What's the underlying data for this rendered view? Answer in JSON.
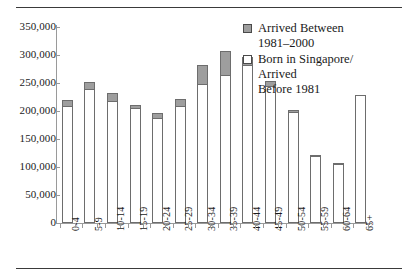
{
  "chart_data": {
    "type": "bar",
    "subtype": "stacked-vertical",
    "title": "",
    "xlabel": "",
    "ylabel": "",
    "ylim": [
      0,
      350000
    ],
    "ytick_values": [
      0,
      50000,
      100000,
      150000,
      200000,
      250000,
      300000,
      350000
    ],
    "ytick_labels": [
      "0",
      "50,000",
      "100,000",
      "150,000",
      "200,000",
      "250,000",
      "300,000",
      "350,000"
    ],
    "grid": false,
    "legend_position": "top-right",
    "categories": [
      "0-4",
      "5-9",
      "10-14",
      "15-19",
      "20-24",
      "25-29",
      "30-34",
      "35-39",
      "40-44",
      "45-49",
      "50-54",
      "55-59",
      "60-64",
      "65+"
    ],
    "series": [
      {
        "name": "Born in Singapore/ Arrived Before 1981",
        "color": "#ffffff",
        "values": [
          207000,
          237000,
          216000,
          203000,
          186000,
          207000,
          247000,
          263000,
          281000,
          243000,
          197000,
          119000,
          106000,
          229000
        ]
      },
      {
        "name": "Arrived Between 1981-2000",
        "color": "#9e9e9e",
        "values": [
          13000,
          15000,
          17000,
          7000,
          10000,
          15000,
          35000,
          45000,
          16000,
          10000,
          5000,
          3000,
          2000,
          0
        ]
      }
    ],
    "totals": [
      220000,
      252000,
      233000,
      210000,
      196000,
      222000,
      282000,
      308000,
      297000,
      253000,
      202000,
      122000,
      108000,
      229000
    ]
  },
  "legend": {
    "items": [
      {
        "swatch": "filled",
        "label": "Arrived Between\n1981–2000"
      },
      {
        "swatch": "hollow",
        "label": "Born in Singapore/\nArrived\nBefore 1981"
      }
    ]
  },
  "colors": {
    "bar_fill_arrived": "#9e9e9e",
    "bar_fill_born": "#ffffff",
    "bar_stroke": "#6d6d6d",
    "axis": "#9a9a9a",
    "rule": "#3a3a3a",
    "text": "#1a1a1a"
  }
}
